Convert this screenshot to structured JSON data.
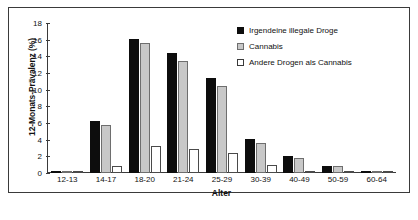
{
  "chart_data": {
    "type": "bar",
    "title": "",
    "xlabel": "Alter",
    "ylabel": "12-Monats-Prävalenz (%)",
    "ylim": [
      0,
      18
    ],
    "yticks": [
      0,
      2,
      4,
      6,
      8,
      10,
      12,
      14,
      16,
      18
    ],
    "grid": false,
    "legend_position": "top-right",
    "categories": [
      "12-13",
      "14-17",
      "18-20",
      "21-24",
      "25-29",
      "30-39",
      "40-49",
      "50-59",
      "60-64"
    ],
    "series": [
      {
        "name": "Irgendeine illegale Droge",
        "color": "#0d0d0d",
        "values": [
          0.3,
          6.3,
          16.1,
          14.4,
          11.4,
          4.1,
          2.0,
          0.9,
          0.2
        ]
      },
      {
        "name": "Cannabis",
        "color": "#c8c8c8",
        "values": [
          0.2,
          5.8,
          15.6,
          13.4,
          10.5,
          3.6,
          1.8,
          0.8,
          0.1
        ]
      },
      {
        "name": "Andere Drogen als Cannabis",
        "color": "#ffffff",
        "values": [
          0.1,
          0.9,
          3.2,
          2.9,
          2.4,
          1.0,
          0.3,
          0.2,
          0.1
        ]
      }
    ]
  },
  "legend": {
    "items": [
      {
        "label": "Irgendeine illegale Droge",
        "swatch": "legend-swatch-black"
      },
      {
        "label": "Cannabis",
        "swatch": "legend-swatch-gray"
      },
      {
        "label": "Andere Drogen als Cannabis",
        "swatch": "legend-swatch-white"
      }
    ]
  }
}
